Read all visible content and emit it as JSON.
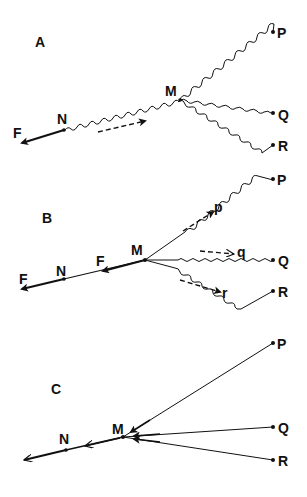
{
  "colors": {
    "ink": "#111111",
    "background": "#ffffff"
  },
  "panels": [
    {
      "id": "A",
      "label": "A",
      "points": {
        "N": "N",
        "M": "M",
        "P": "P",
        "Q": "Q",
        "R": "R",
        "F": "F"
      },
      "description": "Wavy lines from M to P, Q, R and from N to M; force F at N; dashed arrow along N-M"
    },
    {
      "id": "B",
      "label": "B",
      "points": {
        "N": "N",
        "M": "M",
        "P": "P",
        "Q": "Q",
        "R": "R",
        "F1": "F",
        "F2": "F"
      },
      "sub_labels": {
        "p": "p",
        "q": "q",
        "r": "r"
      },
      "description": "Straight segments near M becoming wavy toward P, Q, R; dashed arrows p, q, r"
    },
    {
      "id": "C",
      "label": "C",
      "points": {
        "N": "N",
        "M": "M",
        "P": "P",
        "Q": "Q",
        "R": "R"
      },
      "description": "Straight taut lines from M to P, Q, R with arrows toward M; force along N"
    }
  ]
}
